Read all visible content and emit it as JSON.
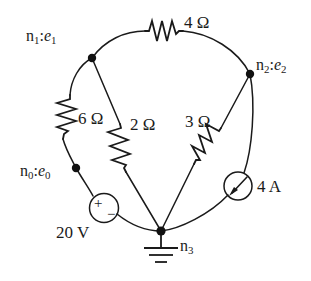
{
  "diagram": {
    "background_color": "#ffffff",
    "line_color": "#1a1a1a"
  },
  "nodes": [
    {
      "id": "n1",
      "name_prefix": "n",
      "name_sub": "1",
      "sep": ":",
      "var": "e",
      "var_sub": "1",
      "x": 92,
      "y": 58
    },
    {
      "id": "n2",
      "name_prefix": "n",
      "name_sub": "2",
      "sep": ":",
      "var": "e",
      "var_sub": "2",
      "x": 250,
      "y": 74
    },
    {
      "id": "n0",
      "name_prefix": "n",
      "name_sub": "0",
      "sep": ":",
      "var": "e",
      "var_sub": "0",
      "x": 76,
      "y": 168
    },
    {
      "id": "n3",
      "name_prefix": "n",
      "name_sub": "3",
      "sep": "",
      "var": "",
      "var_sub": "",
      "x": 161,
      "y": 231
    }
  ],
  "labels": {
    "n1": {
      "n": "n",
      "n_sub": "1",
      "colon": ":",
      "e": "e",
      "e_sub": "1"
    },
    "n2": {
      "n": "n",
      "n_sub": "2",
      "colon": ":",
      "e": "e",
      "e_sub": "2"
    },
    "n0": {
      "n": "n",
      "n_sub": "0",
      "colon": ":",
      "e": "e",
      "e_sub": "0"
    },
    "n3": {
      "n": "n",
      "n_sub": "3"
    }
  },
  "components": {
    "r4": {
      "kind": "resistor",
      "value": "4",
      "unit": "Ω",
      "label": "4 Ω",
      "between": [
        "n1",
        "n2"
      ]
    },
    "r6": {
      "kind": "resistor",
      "value": "6",
      "unit": "Ω",
      "label": "6 Ω",
      "between": [
        "n1",
        "n0"
      ]
    },
    "r2": {
      "kind": "resistor",
      "value": "2",
      "unit": "Ω",
      "label": "2 Ω",
      "between": [
        "n1",
        "n3"
      ]
    },
    "r3": {
      "kind": "resistor",
      "value": "3",
      "unit": "Ω",
      "label": "3 Ω",
      "between": [
        "n2",
        "n3"
      ]
    },
    "vsrc": {
      "kind": "voltage-source",
      "value": "20",
      "unit": "V",
      "label": "20 V",
      "plus": "+",
      "minus": "−",
      "between": [
        "n0",
        "n3"
      ]
    },
    "isrc": {
      "kind": "current-source",
      "value": "4",
      "unit": "A",
      "label": "4 A",
      "between": [
        "n2",
        "n3"
      ]
    }
  },
  "ground": {
    "at_node": "n3",
    "symbol": "earth-ground"
  }
}
